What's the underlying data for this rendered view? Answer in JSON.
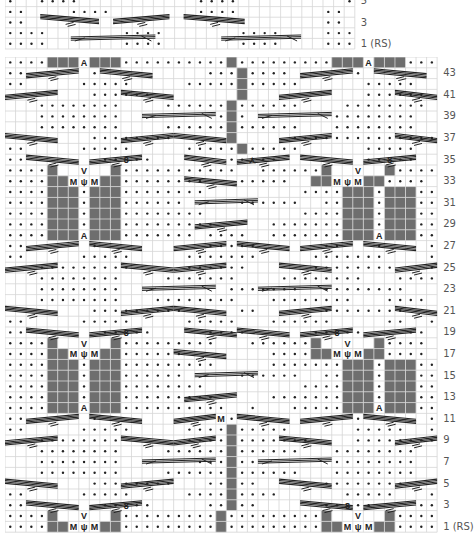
{
  "colors": {
    "grid_line": "#d6d6d6",
    "grid_bg": "#ffffff",
    "no_stitch": "#6e6e6e",
    "purl_dot": "#222222",
    "cable_line": "#222222",
    "label": "#555555"
  },
  "top_chart": {
    "name": "upper-chart-fragment",
    "x": 5,
    "y": -4,
    "cols": 33,
    "rows": 5,
    "cell_w": 10.6,
    "cell_h": 10.6,
    "rows_data": [
      {
        "row": 5,
        "cells": ".  ....           ....          .."
      },
      {
        "row": 4,
        "cells": "..    ....        ....        .. "
      },
      {
        "row": 3,
        "cells": "..                            .."
      },
      {
        "row": 2,
        "cells": "....       ....       ....    ...."
      },
      {
        "row": 1,
        "cells": "....       ....       ....    ...."
      }
    ],
    "labels": [
      {
        "row": 5,
        "text": "5"
      },
      {
        "row": 3,
        "text": "3"
      },
      {
        "row": 1,
        "text": "1 (RS)"
      }
    ],
    "cables": [
      {
        "row": 3,
        "x1": 7.5,
        "x2": 20,
        "dir": "down",
        "y": 23
      },
      {
        "row": 3,
        "x1": 23,
        "x2": 35,
        "dir": "up",
        "y": 23
      },
      {
        "row": 3,
        "x1": 38,
        "x2": 51,
        "dir": "down",
        "y": 23
      },
      {
        "row": 1,
        "x1": 14,
        "x2": 32,
        "dir": "cross",
        "y": 43
      },
      {
        "row": 1,
        "x1": 46,
        "x2": 63,
        "dir": "cross",
        "y": 43
      }
    ]
  },
  "main_chart": {
    "name": "main-knitting-chart",
    "x": 5,
    "y": 57,
    "cols": 41,
    "rows": 44,
    "cell_w": 10.54,
    "cell_h": 10.8,
    "legend_note": "Chart symbols: dot = purl, gray = no stitch, M = make one, A = decrease, ψ = increase, cables drawn as diagonal line groups",
    "rows_data": [
      {
        "row": 44,
        "cells": "....###A###..........#.........###A###...."
      },
      {
        "row": 43,
        "cells": "..      .          ...#....      .        .."
      },
      {
        "row": 42,
        "cells": "..     .....     .....#.....      .....  .."
      },
      {
        "row": 41,
        "cells": "        ......        #           ......   "
      },
      {
        "row": 40,
        "cells": "   ........    ......#......    ........   "
      },
      {
        "row": 39,
        "cells": "   ........         .#.        ........    "
      },
      {
        "row": 38,
        "cells": "   ........    ......#......   ........    "
      },
      {
        "row": 37,
        "cells": "        ........     #     ..............  "
      },
      {
        "row": 36,
        "cells": "..     .....     .....#.....      .....  .."
      },
      {
        "row": 35,
        "cells": "..       ..o..       ..L..        ..o..  .."
      },
      {
        "row": 34,
        "cells": "....#  V  #...........  ......#  V  #...."
      },
      {
        "row": 33,
        "cells": "....##MψM##........   .....  ##MψM##...."
      },
      {
        "row": 32,
        "cells": "....###.###........         ....###.###...."
      },
      {
        "row": 31,
        "cells": "....###.###......     ......  ..###.###...."
      },
      {
        "row": 30,
        "cells": "....###.###........         ....###.###...."
      },
      {
        "row": 29,
        "cells": "....###.###.........     .......###.###...."
      },
      {
        "row": 28,
        "cells": "....###A###....... ....  .......###A###...."
      },
      {
        "row": 27,
        "cells": "..      .          .....      ..   .    .."
      },
      {
        "row": 26,
        "cells": "..     .....     .......     .......    .."
      },
      {
        "row": 25,
        "cells": "   .........     ......      ........   ."
      },
      {
        "row": 24,
        "cells": "   ........    .......    ........   ...."
      },
      {
        "row": 23,
        "cells": "   ........          .......  ........   "
      },
      {
        "row": 22,
        "cells": "   ........   ........   ........   ...."
      },
      {
        "row": 21,
        "cells": "        .........     ..      ........   "
      },
      {
        "row": 20,
        "cells": "..     .....     .....   ......     ..  .."
      },
      {
        "row": 19,
        "cells": "..       ..o..     ....      ..o..    .."
      },
      {
        "row": 18,
        "cells": "....#  V  #.........   ......#  V  #...."
      },
      {
        "row": 17,
        "cells": "....##MψM##......        ....##MψM##...."
      },
      {
        "row": 16,
        "cells": "....###.###.........     .......###.###...."
      },
      {
        "row": 15,
        "cells": "....###.###......     ......  ..###.###...."
      },
      {
        "row": 14,
        "cells": "....###.###........         ....###.###...."
      },
      {
        "row": 13,
        "cells": "....###.###.........     .......###.###...."
      },
      {
        "row": 12,
        "cells": "....###A###..........  .   .....###A###...."
      },
      {
        "row": 11,
        "cells": "..      .           M.           .      .."
      },
      {
        "row": 10,
        "cells": "..     .....     ....#.....      .....  .."
      },
      {
        "row": 9,
        "cells": "   ........      ....#.......    ........ "
      },
      {
        "row": 8,
        "cells": "   ........    ......#......   ........   "
      },
      {
        "row": 7,
        "cells": "   ........       ...#..       ........   "
      },
      {
        "row": 6,
        "cells": "   ........    ......#......   ........   "
      },
      {
        "row": 5,
        "cells": "        ........   ..#..      ........    "
      },
      {
        "row": 4,
        "cells": "..     .....     ....#....      .....   .."
      },
      {
        "row": 3,
        "cells": "..       ..o..     ..#..      ..o..    .."
      },
      {
        "row": 2,
        "cells": "....#  V  #.........#.........#  V  #...."
      },
      {
        "row": 1,
        "cells": "....##MψM##.........#.........##MψM##...."
      }
    ],
    "labels": [
      {
        "row": 43,
        "text": "43"
      },
      {
        "row": 41,
        "text": "41"
      },
      {
        "row": 39,
        "text": "39"
      },
      {
        "row": 37,
        "text": "37"
      },
      {
        "row": 35,
        "text": "35"
      },
      {
        "row": 33,
        "text": "33"
      },
      {
        "row": 31,
        "text": "31"
      },
      {
        "row": 29,
        "text": "29"
      },
      {
        "row": 27,
        "text": "27"
      },
      {
        "row": 25,
        "text": "25"
      },
      {
        "row": 23,
        "text": "23"
      },
      {
        "row": 21,
        "text": "21"
      },
      {
        "row": 19,
        "text": "19"
      },
      {
        "row": 17,
        "text": "17"
      },
      {
        "row": 15,
        "text": "15"
      },
      {
        "row": 13,
        "text": "13"
      },
      {
        "row": 11,
        "text": "11"
      },
      {
        "row": 9,
        "text": "9"
      },
      {
        "row": 7,
        "text": "7"
      },
      {
        "row": 5,
        "text": "5"
      },
      {
        "row": 3,
        "text": "3"
      },
      {
        "row": 1,
        "text": "1 (RS)"
      }
    ],
    "cables": [
      {
        "row": 43,
        "c1": 2,
        "c2": 7,
        "dir": "up"
      },
      {
        "row": 43,
        "c1": 9,
        "c2": 14,
        "dir": "down"
      },
      {
        "row": 43,
        "c1": 28,
        "c2": 33,
        "dir": "up"
      },
      {
        "row": 43,
        "c1": 35,
        "c2": 40,
        "dir": "down"
      },
      {
        "row": 41,
        "c1": 0,
        "c2": 5,
        "dir": "up"
      },
      {
        "row": 41,
        "c1": 11,
        "c2": 16,
        "dir": "down"
      },
      {
        "row": 41,
        "c1": 26,
        "c2": 31,
        "dir": "up"
      },
      {
        "row": 41,
        "c1": 37,
        "c2": 42,
        "dir": "down"
      },
      {
        "row": 39,
        "c1": 13,
        "c2": 20,
        "dir": "cross"
      },
      {
        "row": 39,
        "c1": 24,
        "c2": 31,
        "dir": "cross"
      },
      {
        "row": 37,
        "c1": 0,
        "c2": 5,
        "dir": "down"
      },
      {
        "row": 37,
        "c1": 11,
        "c2": 16,
        "dir": "up"
      },
      {
        "row": 37,
        "c1": 16,
        "c2": 21,
        "dir": "down"
      },
      {
        "row": 37,
        "c1": 26,
        "c2": 31,
        "dir": "up"
      },
      {
        "row": 37,
        "c1": 37,
        "c2": 42,
        "dir": "down"
      },
      {
        "row": 35,
        "c1": 2,
        "c2": 7,
        "dir": "down"
      },
      {
        "row": 35,
        "c1": 8,
        "c2": 13,
        "dir": "up"
      },
      {
        "row": 35,
        "c1": 17,
        "c2": 21,
        "dir": "down"
      },
      {
        "row": 35,
        "c1": 22,
        "c2": 27,
        "dir": "up"
      },
      {
        "row": 35,
        "c1": 28,
        "c2": 33,
        "dir": "down"
      },
      {
        "row": 35,
        "c1": 34,
        "c2": 39,
        "dir": "up"
      },
      {
        "row": 33,
        "c1": 17,
        "c2": 22,
        "dir": "down"
      },
      {
        "row": 31,
        "c1": 18,
        "c2": 24,
        "dir": "cross"
      },
      {
        "row": 29,
        "c1": 18,
        "c2": 23,
        "dir": "up"
      },
      {
        "row": 27,
        "c1": 2,
        "c2": 7,
        "dir": "up"
      },
      {
        "row": 27,
        "c1": 8,
        "c2": 13,
        "dir": "down"
      },
      {
        "row": 27,
        "c1": 16,
        "c2": 21,
        "dir": "up"
      },
      {
        "row": 27,
        "c1": 22,
        "c2": 27,
        "dir": "down"
      },
      {
        "row": 27,
        "c1": 28,
        "c2": 33,
        "dir": "up"
      },
      {
        "row": 27,
        "c1": 34,
        "c2": 39,
        "dir": "down"
      },
      {
        "row": 25,
        "c1": 0,
        "c2": 5,
        "dir": "up"
      },
      {
        "row": 25,
        "c1": 11,
        "c2": 16,
        "dir": "down"
      },
      {
        "row": 25,
        "c1": 16,
        "c2": 21,
        "dir": "up"
      },
      {
        "row": 25,
        "c1": 26,
        "c2": 31,
        "dir": "down"
      },
      {
        "row": 25,
        "c1": 37,
        "c2": 42,
        "dir": "up"
      },
      {
        "row": 23,
        "c1": 13,
        "c2": 20,
        "dir": "cross"
      },
      {
        "row": 23,
        "c1": 24,
        "c2": 31,
        "dir": "cross"
      },
      {
        "row": 21,
        "c1": 0,
        "c2": 5,
        "dir": "down"
      },
      {
        "row": 21,
        "c1": 11,
        "c2": 16,
        "dir": "up"
      },
      {
        "row": 21,
        "c1": 16,
        "c2": 21,
        "dir": "down"
      },
      {
        "row": 21,
        "c1": 26,
        "c2": 31,
        "dir": "up"
      },
      {
        "row": 21,
        "c1": 37,
        "c2": 42,
        "dir": "down"
      },
      {
        "row": 19,
        "c1": 2,
        "c2": 7,
        "dir": "down"
      },
      {
        "row": 19,
        "c1": 8,
        "c2": 13,
        "dir": "up"
      },
      {
        "row": 19,
        "c1": 17,
        "c2": 22,
        "dir": "down"
      },
      {
        "row": 19,
        "c1": 22,
        "c2": 27,
        "dir": "down"
      },
      {
        "row": 19,
        "c1": 28,
        "c2": 33,
        "dir": "up"
      },
      {
        "row": 19,
        "c1": 34,
        "c2": 39,
        "dir": "up"
      },
      {
        "row": 17,
        "c1": 16,
        "c2": 21,
        "dir": "down"
      },
      {
        "row": 15,
        "c1": 18,
        "c2": 24,
        "dir": "cross"
      },
      {
        "row": 13,
        "c1": 17,
        "c2": 22,
        "dir": "up"
      },
      {
        "row": 11,
        "c1": 2,
        "c2": 7,
        "dir": "up"
      },
      {
        "row": 11,
        "c1": 8,
        "c2": 13,
        "dir": "down"
      },
      {
        "row": 11,
        "c1": 16,
        "c2": 20,
        "dir": "up"
      },
      {
        "row": 11,
        "c1": 22,
        "c2": 27,
        "dir": "down"
      },
      {
        "row": 11,
        "c1": 28,
        "c2": 33,
        "dir": "up"
      },
      {
        "row": 11,
        "c1": 34,
        "c2": 39,
        "dir": "down"
      },
      {
        "row": 9,
        "c1": 0,
        "c2": 5,
        "dir": "up"
      },
      {
        "row": 9,
        "c1": 11,
        "c2": 16,
        "dir": "down"
      },
      {
        "row": 9,
        "c1": 16,
        "c2": 20,
        "dir": "up"
      },
      {
        "row": 9,
        "c1": 26,
        "c2": 31,
        "dir": "down"
      },
      {
        "row": 9,
        "c1": 37,
        "c2": 42,
        "dir": "up"
      },
      {
        "row": 7,
        "c1": 13,
        "c2": 20,
        "dir": "cross"
      },
      {
        "row": 7,
        "c1": 24,
        "c2": 31,
        "dir": "cross"
      },
      {
        "row": 5,
        "c1": 0,
        "c2": 5,
        "dir": "down"
      },
      {
        "row": 5,
        "c1": 11,
        "c2": 16,
        "dir": "up"
      },
      {
        "row": 5,
        "c1": 26,
        "c2": 31,
        "dir": "down"
      },
      {
        "row": 5,
        "c1": 37,
        "c2": 42,
        "dir": "up"
      },
      {
        "row": 3,
        "c1": 2,
        "c2": 7,
        "dir": "down"
      },
      {
        "row": 3,
        "c1": 8,
        "c2": 13,
        "dir": "up"
      },
      {
        "row": 3,
        "c1": 28,
        "c2": 33,
        "dir": "down"
      },
      {
        "row": 3,
        "c1": 34,
        "c2": 39,
        "dir": "up"
      }
    ]
  }
}
